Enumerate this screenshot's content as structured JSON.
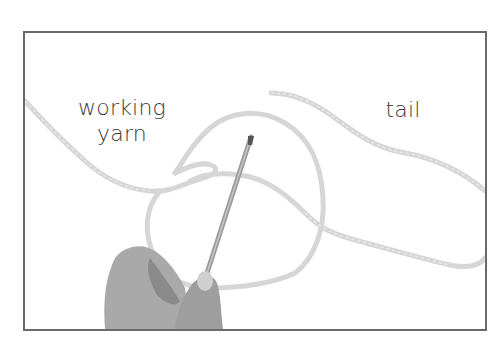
{
  "figure": {
    "labels": {
      "working_yarn_line1": "working",
      "working_yarn_line2": "yarn",
      "tail": "tail"
    },
    "colors": {
      "frame": "#6a6a6a",
      "yarn": "#d4d4d4",
      "text": "#3a3a3a",
      "needle": "#9a9a9a",
      "skin": "#a8a8a8"
    }
  }
}
